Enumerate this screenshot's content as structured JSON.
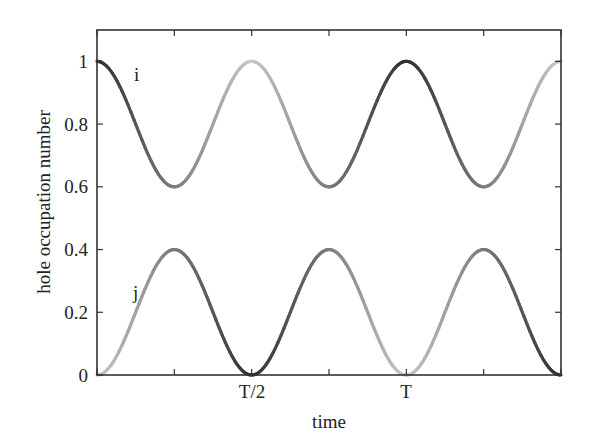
{
  "chart_data": {
    "type": "line",
    "title": "",
    "xlabel": "time",
    "ylabel": "hole occupation number",
    "xlim": [
      0,
      1.5
    ],
    "ylim": [
      0,
      1.1
    ],
    "x_ticks": [
      0,
      0.25,
      0.5,
      0.75,
      1.0,
      1.25,
      1.5
    ],
    "x_tick_labels": [
      "",
      "",
      "T/2",
      "",
      "T",
      "",
      ""
    ],
    "y_ticks": [
      0,
      0.2,
      0.4,
      0.6,
      0.8,
      1
    ],
    "y_tick_labels": [
      "0",
      "0.2",
      "0.4",
      "0.6",
      "0.8",
      "1"
    ],
    "grid": false,
    "legend": "none",
    "series": [
      {
        "name": "i",
        "label_position": [
          0.06,
          0.94
        ],
        "formula": "0.8 + 0.2*cos(4*pi*t/T)",
        "x": [
          0,
          0.125,
          0.25,
          0.375,
          0.5,
          0.625,
          0.75,
          0.875,
          1.0,
          1.125,
          1.25,
          1.375,
          1.5
        ],
        "values": [
          1.0,
          0.8,
          0.6,
          0.8,
          1.0,
          0.8,
          0.6,
          0.8,
          1.0,
          0.8,
          0.6,
          0.8,
          1.0
        ],
        "min": 0.6,
        "max": 1.0
      },
      {
        "name": "j",
        "label_position": [
          0.06,
          0.28
        ],
        "formula": "0.2 - 0.2*cos(4*pi*t/T)",
        "x": [
          0,
          0.125,
          0.25,
          0.375,
          0.5,
          0.625,
          0.75,
          0.875,
          1.0,
          1.125,
          1.25,
          1.375,
          1.5
        ],
        "values": [
          0.0,
          0.2,
          0.4,
          0.2,
          0.0,
          0.2,
          0.4,
          0.2,
          0.0,
          0.2,
          0.4,
          0.2,
          0.0
        ],
        "min": 0.0,
        "max": 0.4
      }
    ],
    "segment_shading": "curves alternate between dark and light gray every quarter period (T/4), indicating which site holds the hole",
    "colors": {
      "dark": "#2f2f2f",
      "medium": "#707070",
      "light": "#c4c4c4",
      "axis": "#333333"
    }
  },
  "labels": {
    "curve_i": "i",
    "curve_j": "j",
    "xlabel": "time",
    "ylabel": "hole occupation number",
    "xtick_half": "T/2",
    "xtick_full": "T",
    "y0": "0",
    "y02": "0.2",
    "y04": "0.4",
    "y06": "0.6",
    "y08": "0.8",
    "y1": "1"
  }
}
